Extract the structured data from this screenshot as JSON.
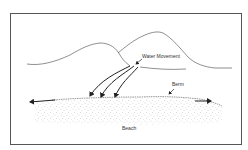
{
  "diagram": {
    "labels": {
      "water_movement": "Water Movement",
      "berm": "Berm",
      "beach": "Beach"
    },
    "colors": {
      "line": "#333333",
      "frame": "#555555",
      "sand": "#666666",
      "background": "#ffffff"
    }
  }
}
